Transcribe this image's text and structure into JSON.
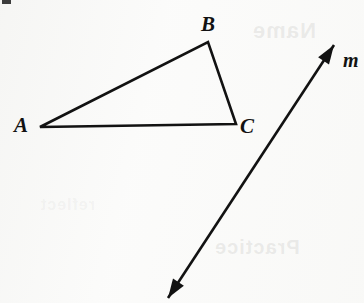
{
  "figure": {
    "background_color": "#fbfbfa",
    "ink_color": "#121212",
    "width": 364,
    "height": 303
  },
  "labels": {
    "vertex_a": "A",
    "vertex_b": "B",
    "vertex_c": "C",
    "line_m": "m"
  },
  "geometry": {
    "triangle": {
      "name": "triangle-ABC",
      "vertices": [
        {
          "id": "A",
          "x": 40,
          "y": 127
        },
        {
          "id": "B",
          "x": 208,
          "y": 42
        },
        {
          "id": "C",
          "x": 236,
          "y": 124
        }
      ],
      "edges": [
        "AB",
        "BC",
        "CA"
      ],
      "stroke_width": 2.6,
      "filled": false
    },
    "line": {
      "name": "line-m",
      "id": "m",
      "start": {
        "x": 168,
        "y": 298
      },
      "end": {
        "x": 334,
        "y": 45
      },
      "arrowheads": "both",
      "stroke_width": 2.6
    }
  },
  "bleed_through": {
    "top": "Name",
    "middle": "Practice",
    "bottom": "reflect"
  }
}
